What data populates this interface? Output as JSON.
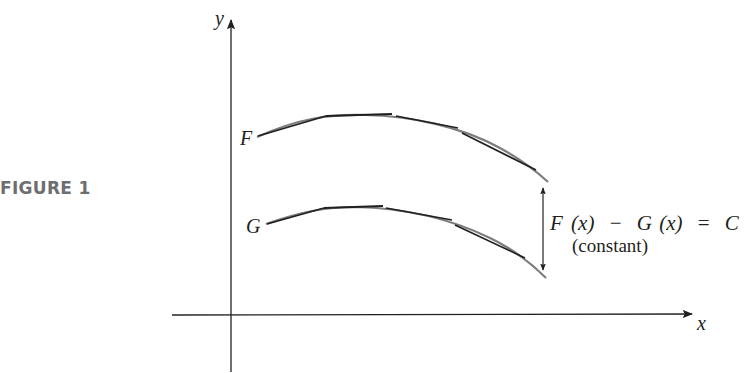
{
  "figure": {
    "label": "FIGURE 1",
    "label_color": "#6d6e70"
  },
  "axes": {
    "x_label": "x",
    "y_label": "y",
    "color": "#231f20"
  },
  "curves": {
    "F": {
      "label": "F",
      "color": "#231f20",
      "tangent_color": "#8a8a8a"
    },
    "G": {
      "label": "G",
      "color": "#231f20",
      "tangent_color": "#8a8a8a"
    }
  },
  "annotation": {
    "equation_F": "F",
    "equation_x1": "(x)",
    "equation_minus": "−",
    "equation_G": "G",
    "equation_x2": "(x)",
    "equation_eq": "=",
    "equation_C": "C",
    "note": "(constant)"
  }
}
